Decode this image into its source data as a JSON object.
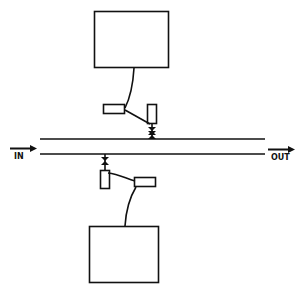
{
  "diagram": {
    "labels": {
      "input": "IN",
      "output": "OUT"
    },
    "colors": {
      "stroke": "#111111",
      "background": "#ffffff"
    },
    "components": {
      "top_unit": "upper box (device) connected via cable to sensor assembly above the line",
      "bottom_unit": "lower box (device) connected via cable to sensor assembly below the line",
      "flow_channel": "two parallel horizontal lines forming a pipe/channel",
      "top_valve": "small valve symbol connecting upper sensor to channel",
      "bottom_valve": "small valve symbol connecting lower sensor to channel"
    }
  }
}
